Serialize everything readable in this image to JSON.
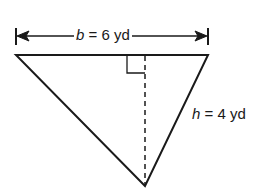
{
  "diagram": {
    "shape": "triangle",
    "base": {
      "variable": "b",
      "equals": "=",
      "value": "6 yd"
    },
    "height": {
      "variable": "h",
      "equals": "=",
      "value": "4 yd"
    },
    "altitude_style": "dashed",
    "right_angle_marker": true,
    "colors": {
      "stroke": "#1a1a1a",
      "background": "#ffffff"
    }
  }
}
